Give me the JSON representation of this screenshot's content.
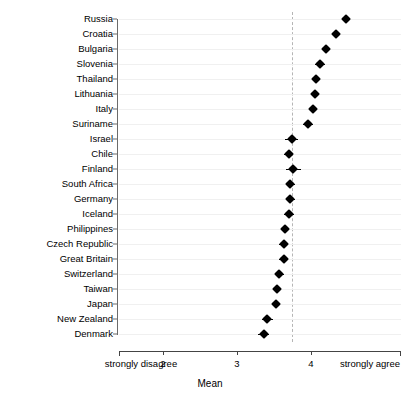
{
  "chart_data": {
    "type": "scatter",
    "title": "",
    "subtitle": "",
    "xlabel": "Mean",
    "ylabel": "",
    "xlim": [
      1.2,
      5.0
    ],
    "xticks": [
      2,
      3,
      4
    ],
    "xticklabels": [
      "2",
      "3",
      "4"
    ],
    "x_axis_end_labels": {
      "left": "strongly disagree",
      "right": "strongly agree"
    },
    "grid": true,
    "legend": "none",
    "orientation": "horizontal",
    "reference_line": {
      "value": 3.74,
      "style": "dashed",
      "color": "#b5b5b5",
      "label": ""
    },
    "categories": [
      "Russia",
      "Croatia",
      "Bulgaria",
      "Slovenia",
      "Thailand",
      "Lithuania",
      "Italy",
      "Suriname",
      "Israel",
      "Chile",
      "Finland",
      "South Africa",
      "Germany",
      "Iceland",
      "Philippines",
      "Czech Republic",
      "Great Britain",
      "Switzerland",
      "Taiwan",
      "Japan",
      "New Zealand",
      "Denmark"
    ],
    "values": [
      4.47,
      4.34,
      4.2,
      4.12,
      4.07,
      4.05,
      4.03,
      3.96,
      3.74,
      3.7,
      3.76,
      3.72,
      3.72,
      3.7,
      3.65,
      3.63,
      3.63,
      3.57,
      3.54,
      3.53,
      3.41,
      3.36
    ],
    "errors": [
      0.05,
      0.05,
      0.05,
      0.07,
      0.05,
      0.05,
      0.05,
      0.07,
      0.09,
      0.06,
      0.1,
      0.06,
      0.06,
      0.07,
      0.05,
      0.06,
      0.06,
      0.06,
      0.05,
      0.05,
      0.07,
      0.07
    ],
    "marker": "filled-diamond",
    "marker_color": "#000000"
  },
  "axis": {
    "left_end_label": "strongly disagree",
    "right_end_label": "strongly agree",
    "tick_2": "2",
    "tick_3": "3",
    "tick_4": "4",
    "x_title": "Mean"
  }
}
